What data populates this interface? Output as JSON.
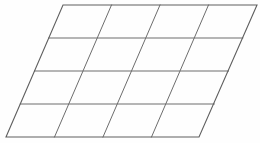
{
  "figure": {
    "name": "parallelogram-grid",
    "shape_type": "parallelogram",
    "rows": 4,
    "columns": 4,
    "cell_count": 16,
    "background_color": "#fefefe",
    "line_color": "#6d6d6d",
    "outline_color": "#5f5f5f",
    "line_width": 1,
    "outline_width": 1.1,
    "canvas": {
      "width": 260,
      "height": 143
    },
    "corners": {
      "top_left": [
        63,
        5
      ],
      "top_right": [
        257,
        5
      ],
      "bottom_right": [
        199,
        137
      ],
      "bottom_left": [
        6,
        137
      ]
    },
    "outline_path": "M63,5 L257,5 L199,137 L6,137 Z",
    "horizontal_lines": [
      {
        "label": "row-divider-1",
        "path": "M48.75,38 L242.75,38"
      },
      {
        "label": "row-divider-2",
        "path": "M34.5,71 L228.5,71"
      },
      {
        "label": "row-divider-3",
        "path": "M20.25,104 L214.25,104"
      }
    ],
    "diagonal_lines": [
      {
        "label": "column-divider-1",
        "path": "M111.5,5 L54.5,137"
      },
      {
        "label": "column-divider-2",
        "path": "M160,5 L103,137"
      },
      {
        "label": "column-divider-3",
        "path": "M208.5,5 L151.5,137"
      }
    ],
    "top_edge_node_x": [
      63,
      111.5,
      160,
      208.5,
      257
    ],
    "bottom_edge_node_x": [
      6,
      54.5,
      103,
      151.5,
      199
    ],
    "left_edge_node_y": [
      5,
      38,
      71,
      104,
      137
    ],
    "horizontal_line_y": [
      5,
      38,
      71,
      104,
      137
    ]
  }
}
